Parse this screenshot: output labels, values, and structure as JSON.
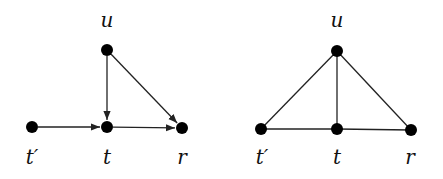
{
  "diagram": {
    "graphs": [
      {
        "name": "directed-graph",
        "directed": true,
        "nodes": [
          {
            "id": "u",
            "label": "u",
            "x": 107,
            "y": 50,
            "lx": 107,
            "ly": 27
          },
          {
            "id": "tp",
            "label": "t′",
            "x": 32,
            "y": 127,
            "lx": 32,
            "ly": 164
          },
          {
            "id": "t",
            "label": "t",
            "x": 107,
            "y": 127,
            "lx": 107,
            "ly": 164
          },
          {
            "id": "r",
            "label": "r",
            "x": 182,
            "y": 128,
            "lx": 182,
            "ly": 164
          }
        ],
        "edges": [
          {
            "from": "tp",
            "to": "t"
          },
          {
            "from": "t",
            "to": "r"
          },
          {
            "from": "u",
            "to": "t"
          },
          {
            "from": "u",
            "to": "r"
          }
        ]
      },
      {
        "name": "undirected-graph",
        "directed": false,
        "nodes": [
          {
            "id": "u",
            "label": "u",
            "x": 337,
            "y": 51,
            "lx": 337,
            "ly": 27
          },
          {
            "id": "tp",
            "label": "t′",
            "x": 261,
            "y": 129,
            "lx": 262,
            "ly": 164
          },
          {
            "id": "t",
            "label": "t",
            "x": 337,
            "y": 129,
            "lx": 337,
            "ly": 164
          },
          {
            "id": "r",
            "label": "r",
            "x": 411,
            "y": 130,
            "lx": 410,
            "ly": 164
          }
        ],
        "edges": [
          {
            "from": "tp",
            "to": "t"
          },
          {
            "from": "t",
            "to": "r"
          },
          {
            "from": "u",
            "to": "t"
          },
          {
            "from": "u",
            "to": "r"
          },
          {
            "from": "u",
            "to": "tp"
          }
        ]
      }
    ]
  }
}
